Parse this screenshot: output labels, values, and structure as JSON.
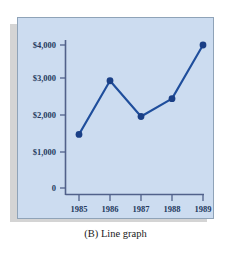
{
  "caption": "(B) Line graph",
  "colors": {
    "panel_background": "#ccdcf0",
    "panel_border": "#8fa3b8",
    "shadow": "#d4d4d4",
    "series_line": "#1f4e9c",
    "marker": "#1a3f86",
    "axis": "#51618a",
    "text": "#243a5e",
    "page_background": "#ffffff"
  },
  "chart_data": {
    "type": "line",
    "title": "",
    "subtitle": "",
    "xlabel": "",
    "ylabel": "",
    "categories": [
      "1985",
      "1986",
      "1987",
      "1988",
      "1989"
    ],
    "x": [
      1985,
      1986,
      1987,
      1988,
      1989
    ],
    "values": [
      1500,
      3000,
      2000,
      2500,
      4000
    ],
    "series": [
      {
        "name": "",
        "values": [
          1500,
          3000,
          2000,
          2500,
          4000
        ]
      }
    ],
    "ylim": [
      0,
      4500
    ],
    "xlim": [
      1984.5,
      1989.5
    ],
    "yticks": [
      0,
      1000,
      2000,
      3000,
      4000
    ],
    "ytick_labels": [
      "0",
      "$1,000",
      "$2,000",
      "$3,000",
      "$4,000"
    ],
    "xtick_labels": [
      "1985",
      "1986",
      "1987",
      "1988",
      "1989"
    ],
    "grid": false,
    "legend": false,
    "legend_position": "none",
    "markers": true,
    "marker_shape": "circle",
    "annotations": []
  },
  "axes": {
    "y_labels": [
      {
        "value": 4000,
        "text": "$4,000"
      },
      {
        "value": 3000,
        "text": "$3,000"
      },
      {
        "value": 2000,
        "text": "$2,000"
      },
      {
        "value": 1000,
        "text": "$1,000"
      },
      {
        "value": 0,
        "text": "0"
      }
    ],
    "x_labels": [
      {
        "value": 1985,
        "text": "1985"
      },
      {
        "value": 1986,
        "text": "1986"
      },
      {
        "value": 1987,
        "text": "1987"
      },
      {
        "value": 1988,
        "text": "1988"
      },
      {
        "value": 1989,
        "text": "1989"
      }
    ]
  }
}
